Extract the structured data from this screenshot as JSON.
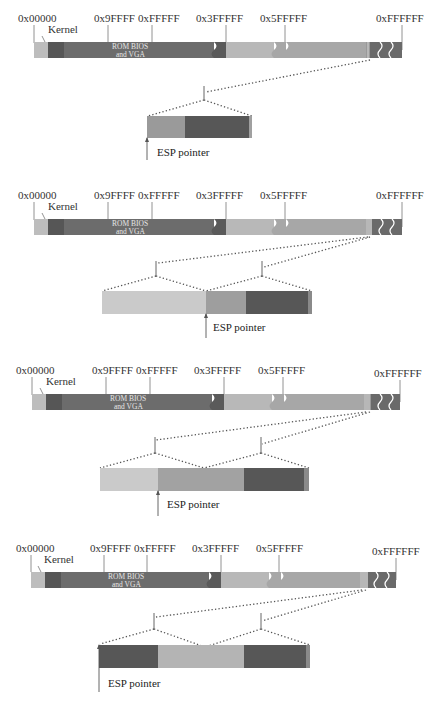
{
  "colors": {
    "kernel": "#b9b9b9",
    "dark": "#5e5e5e",
    "mid": "#7a7a7a",
    "light": "#bdbdbd",
    "lighter": "#cfcfcf",
    "rom": "#6a6a6a",
    "dots": "#555555"
  },
  "memory_map": {
    "addresses": [
      "0x00000",
      "0x9FFFF",
      "0xFFFFF",
      "0x3FFFFF",
      "0x5FFFFF",
      "0xFFFFFF"
    ],
    "kernel_label": "Kernel",
    "rom_label_line1": "ROM BIOS",
    "rom_label_line2": "and VGA"
  },
  "stages": [
    {
      "esp_label": "ESP pointer",
      "stack_segments": [
        "mid",
        "dark"
      ],
      "esp_position": "start"
    },
    {
      "esp_label": "ESP pointer",
      "stack_segments": [
        "lighter",
        "mid",
        "dark"
      ],
      "esp_position": "second"
    },
    {
      "esp_label": "ESP pointer",
      "stack_segments": [
        "lighter",
        "mid",
        "dark"
      ],
      "esp_position": "second"
    },
    {
      "esp_label": "ESP pointer",
      "stack_segments": [
        "dark",
        "lighter",
        "dark"
      ],
      "esp_position": "start"
    }
  ]
}
